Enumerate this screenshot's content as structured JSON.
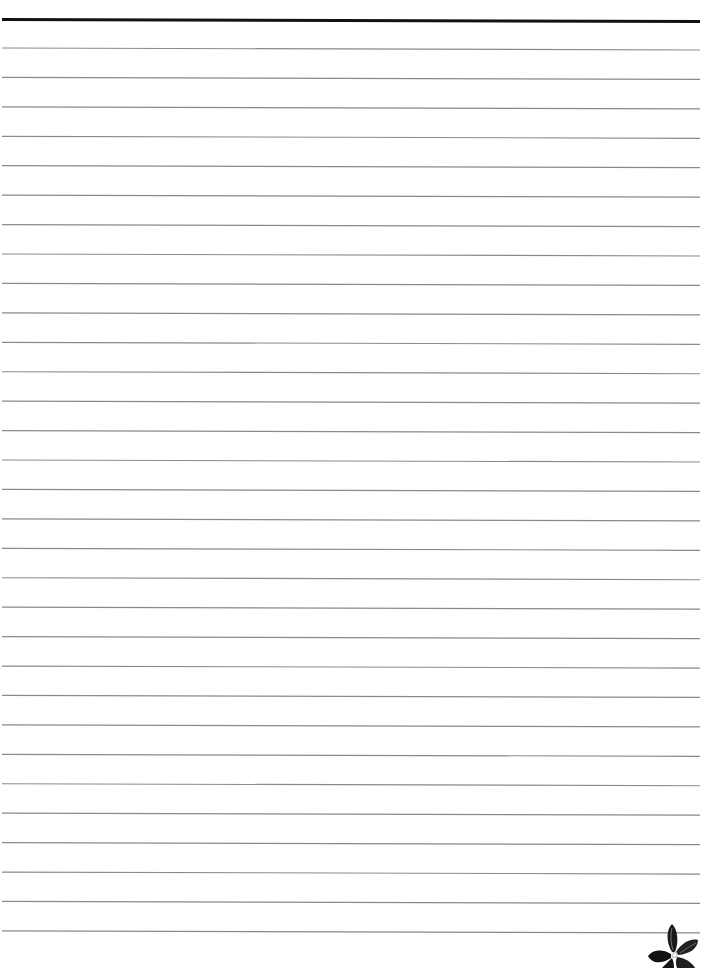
{
  "document": {
    "type": "lined-paper",
    "header_rule": {
      "y_left": 19.5,
      "y_right": 21.5,
      "thickness": 3,
      "color": "#111111"
    },
    "rules": {
      "count": 31,
      "first_y_left": 48,
      "spacing": 29.43,
      "slope_px": 2,
      "x_start": 2,
      "x_end": 700,
      "thickness": 1.2,
      "color": "#8a8a8a"
    },
    "decoration": {
      "icon": "flower-icon",
      "position": "bottom-right",
      "color": "#1a1a1a"
    }
  }
}
